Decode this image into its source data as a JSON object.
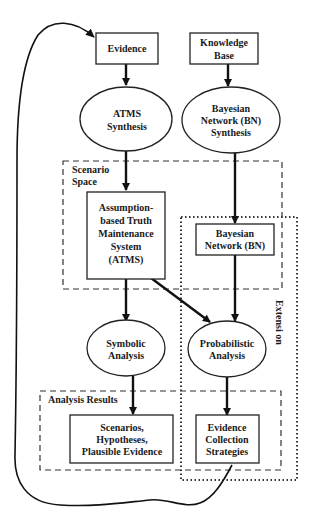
{
  "diagram": {
    "type": "flowchart",
    "nodes": {
      "evidence": {
        "shape": "rectangle",
        "lines": [
          "Evidence"
        ]
      },
      "knowledge_base": {
        "shape": "rectangle",
        "lines": [
          "Knowledge",
          "Base"
        ]
      },
      "atms_synthesis": {
        "shape": "ellipse",
        "lines": [
          "ATMS",
          "Synthesis"
        ]
      },
      "bn_synthesis": {
        "shape": "ellipse",
        "lines": [
          "Bayesian",
          "Network (BN)",
          "Synthesis"
        ]
      },
      "atms": {
        "shape": "rectangle",
        "lines": [
          "Assumption-",
          "based Truth",
          "Maintenance",
          "System",
          "(ATMS)"
        ]
      },
      "bn": {
        "shape": "rectangle",
        "lines": [
          "Bayesian",
          "Network (BN)"
        ]
      },
      "symbolic_analysis": {
        "shape": "ellipse",
        "lines": [
          "Symbolic",
          "Analysis"
        ]
      },
      "probabilistic_analysis": {
        "shape": "ellipse",
        "lines": [
          "Probabilistic",
          "Analysis"
        ]
      },
      "scenarios": {
        "shape": "rectangle",
        "lines": [
          "Scenarios,",
          "Hypotheses,",
          "Plausible Evidence"
        ]
      },
      "evidence_collection": {
        "shape": "rectangle",
        "lines": [
          "Evidence",
          "Collection",
          "Strategies"
        ]
      }
    },
    "groups": {
      "scenario_space": {
        "style": "dashed",
        "lines": [
          "Scenario",
          "Space"
        ]
      },
      "analysis_results": {
        "style": "dashed",
        "label": "Analysis Results"
      },
      "extension": {
        "style": "dotted",
        "label": "Extensi on"
      }
    },
    "edges": [
      {
        "from": "evidence",
        "to": "atms_synthesis"
      },
      {
        "from": "knowledge_base",
        "to": "bn_synthesis"
      },
      {
        "from": "atms_synthesis",
        "to": "atms"
      },
      {
        "from": "bn_synthesis",
        "to": "bn"
      },
      {
        "from": "atms",
        "to": "symbolic_analysis"
      },
      {
        "from": "atms",
        "to": "probabilistic_analysis"
      },
      {
        "from": "bn",
        "to": "probabilistic_analysis"
      },
      {
        "from": "symbolic_analysis",
        "to": "scenarios"
      },
      {
        "from": "probabilistic_analysis",
        "to": "evidence_collection"
      },
      {
        "from": "evidence_collection",
        "to": "evidence",
        "style": "curved-feedback-loop"
      }
    ]
  }
}
